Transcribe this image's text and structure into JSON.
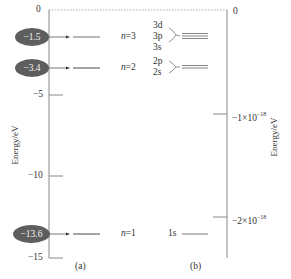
{
  "diagram": {
    "panel_a": {
      "label": "(a)",
      "axis_label": "Energy/eV",
      "ticks": [
        {
          "value": "0"
        },
        {
          "value": "−5"
        },
        {
          "value": "−10"
        },
        {
          "value": "−15"
        }
      ],
      "levels": [
        {
          "energy": "−1.5",
          "n_label": "n",
          "n_value": "=3"
        },
        {
          "energy": "−3.4",
          "n_label": "n",
          "n_value": "=2"
        },
        {
          "energy": "−13.6",
          "n_label": "n",
          "n_value": "=1"
        }
      ]
    },
    "panel_b": {
      "label": "(b)",
      "axis_label": "Energy/eV",
      "ticks": [
        {
          "value": "0"
        },
        {
          "base": "−1×10",
          "exp": "−18"
        },
        {
          "base": "−2×10",
          "exp": "−18"
        }
      ],
      "orbitals_n3": [
        "3d",
        "3p",
        "3s"
      ],
      "orbitals_n2": [
        "2p",
        "2s"
      ],
      "orbital_n1": "1s"
    },
    "colors": {
      "axis": "#888888",
      "oval_fill": "#5e5e5e",
      "oval_text": "#f2f2f2",
      "level_line": "#666666",
      "dotted_zero": "#999999"
    }
  }
}
